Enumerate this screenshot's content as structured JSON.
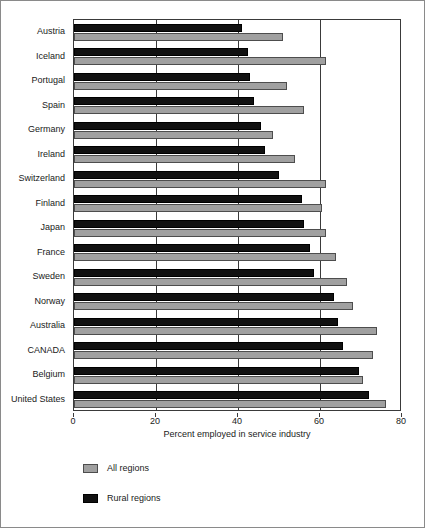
{
  "chart_data": {
    "type": "bar",
    "orientation": "horizontal",
    "title": "",
    "xlabel": "Percent employed in service industry",
    "ylabel": "",
    "xlim": [
      0,
      80
    ],
    "xticks": [
      0,
      20,
      40,
      60,
      80
    ],
    "grid": true,
    "legend_position": "below-plot-left",
    "categories": [
      "Austria",
      "Iceland",
      "Portugal",
      "Spain",
      "Germany",
      "Ireland",
      "Switzerland",
      "Finland",
      "Japan",
      "France",
      "Sweden",
      "Norway",
      "Australia",
      "CANADA",
      "Belgium",
      "United States"
    ],
    "series": [
      {
        "name": "All regions",
        "color": "#a0a0a0",
        "values": [
          51.0,
          61.5,
          52.0,
          56.0,
          48.5,
          54.0,
          61.5,
          60.5,
          61.5,
          64.0,
          66.5,
          68.0,
          74.0,
          73.0,
          70.5,
          76.0
        ]
      },
      {
        "name": "Rural regions",
        "color": "#111111",
        "values": [
          41.0,
          42.5,
          43.0,
          44.0,
          45.5,
          46.5,
          50.0,
          55.5,
          56.0,
          57.5,
          58.5,
          63.5,
          64.5,
          65.5,
          69.5,
          72.0
        ]
      }
    ]
  }
}
